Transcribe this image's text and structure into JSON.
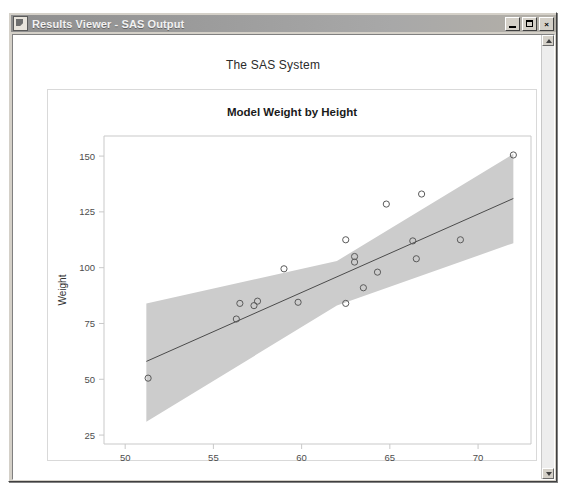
{
  "window": {
    "title": "Results Viewer - SAS Output",
    "icon": "document-icon",
    "buttons": {
      "minimize": "_",
      "maximize": "□",
      "close": "×"
    }
  },
  "report": {
    "system_title": "The SAS System"
  },
  "chart_data": {
    "type": "scatter",
    "title": "Model Weight by Height",
    "xlabel": "Height",
    "ylabel": "Weight",
    "xlim": [
      48.8,
      73.0
    ],
    "ylim": [
      21.0,
      159.0
    ],
    "xticks": [
      50,
      55,
      60,
      65,
      70
    ],
    "yticks": [
      25,
      50,
      75,
      100,
      125,
      150
    ],
    "grid": false,
    "legend": null,
    "series": [
      {
        "name": "Observations",
        "marker": "open-circle",
        "marker_color": "#5a5a5a",
        "points": [
          {
            "x": 51.3,
            "y": 50.5
          },
          {
            "x": 56.3,
            "y": 77.0
          },
          {
            "x": 56.5,
            "y": 84.0
          },
          {
            "x": 57.3,
            "y": 83.0
          },
          {
            "x": 57.5,
            "y": 85.0
          },
          {
            "x": 59.0,
            "y": 99.5
          },
          {
            "x": 59.8,
            "y": 84.5
          },
          {
            "x": 62.5,
            "y": 84.0
          },
          {
            "x": 62.5,
            "y": 112.5
          },
          {
            "x": 63.0,
            "y": 102.5
          },
          {
            "x": 63.0,
            "y": 105.0
          },
          {
            "x": 63.5,
            "y": 91.0
          },
          {
            "x": 64.3,
            "y": 98.0
          },
          {
            "x": 64.8,
            "y": 128.5
          },
          {
            "x": 66.3,
            "y": 112.0
          },
          {
            "x": 66.5,
            "y": 104.0
          },
          {
            "x": 66.8,
            "y": 133.0
          },
          {
            "x": 69.0,
            "y": 112.5
          },
          {
            "x": 72.0,
            "y": 150.5
          }
        ]
      }
    ],
    "fit_line": {
      "name": "Linear fit",
      "color": "#4b4b4b",
      "x": [
        51.2,
        72.0
      ],
      "y": [
        58.0,
        131.0
      ]
    },
    "confidence_band": {
      "name": "95% confidence limits",
      "color": "#cccccc",
      "x": [
        51.2,
        62.0,
        72.0
      ],
      "upper": [
        84.0,
        103.0,
        151.0
      ],
      "lower": [
        31.0,
        83.0,
        111.0
      ]
    }
  }
}
